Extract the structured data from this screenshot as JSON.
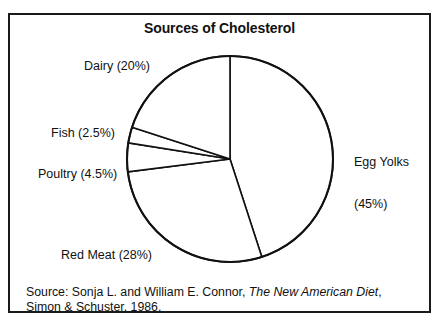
{
  "figure": {
    "title": "Sources of Cholesterol",
    "source_prefix": "Source: Sonja L. and William E. Connor, ",
    "source_book": "The New American Diet",
    "source_suffix": ", Simon & Schuster, 1986."
  },
  "labels": {
    "dairy": "Dairy (20%)",
    "fish": "Fish (2.5%)",
    "poultry": "Poultry (4.5%)",
    "red_meat": "Red Meat (28%)",
    "egg_yolks_line1": "Egg Yolks",
    "egg_yolks_line2": "(45%)"
  },
  "colors": {
    "outline": "#111111",
    "slice_fill": "#ffffff",
    "frame": "#1a1a1a",
    "background": "#ffffff"
  },
  "chart_data": {
    "type": "pie",
    "title": "Sources of Cholesterol",
    "categories": [
      "Egg Yolks",
      "Red Meat",
      "Poultry",
      "Fish",
      "Dairy"
    ],
    "values": [
      45,
      28,
      4.5,
      2.5,
      20
    ],
    "unit": "percent",
    "total": 100,
    "start_angle_deg": 0,
    "direction": "clockwise",
    "legend": "none",
    "labels_placement": "outside",
    "slice_labels": [
      "Egg Yolks (45%)",
      "Red Meat (28%)",
      "Poultry (4.5%)",
      "Fish (2.5%)",
      "Dairy (20%)"
    ],
    "annotation": "Source: Sonja L. and William E. Connor, The New American Diet, Simon & Schuster, 1986."
  }
}
